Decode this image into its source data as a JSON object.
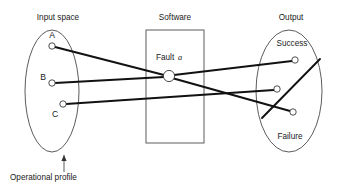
{
  "figure": {
    "type": "diagram",
    "background_color": "#ffffff",
    "line_color": "#111111",
    "outline_color": "#4a4a4a"
  },
  "regions": {
    "input_space": {
      "label": "Input space",
      "shape": "ellipse",
      "label_x": 58,
      "label_y": 20,
      "cx": 52,
      "cy": 91,
      "rx": 27,
      "ry": 61
    },
    "software": {
      "label": "Software",
      "shape": "rectangle",
      "label_x": 175,
      "label_y": 20,
      "x": 146,
      "y": 30,
      "w": 58,
      "h": 113
    },
    "output": {
      "label": "Output",
      "shape": "ellipse",
      "label_x": 291,
      "label_y": 20,
      "cx": 289,
      "cy": 91,
      "rx": 33,
      "ry": 61
    }
  },
  "inner_labels": {
    "fault_text": "Fault",
    "fault_symbol": "a",
    "fault_label_x": 156,
    "fault_label_y": 60,
    "success": "Success",
    "success_x": 292,
    "success_y": 46,
    "failure": "Failure",
    "failure_x": 290,
    "failure_y": 139
  },
  "nodes": {
    "input": [
      {
        "id": "A",
        "label": "A",
        "cx": 52,
        "cy": 46,
        "r": 3.2,
        "label_x": 52,
        "label_y": 38
      },
      {
        "id": "B",
        "label": "B",
        "cx": 52,
        "cy": 83,
        "r": 3.2,
        "label_x": 43,
        "label_y": 80
      },
      {
        "id": "C",
        "label": "C",
        "cx": 63,
        "cy": 104,
        "r": 3.2,
        "label_x": 55,
        "label_y": 117
      }
    ],
    "fault": {
      "id": "fault-a",
      "cx": 169,
      "cy": 76,
      "r": 5.6
    },
    "output": [
      {
        "id": "out1",
        "cx": 295,
        "cy": 60,
        "r": 3.2,
        "region": "success"
      },
      {
        "id": "out2",
        "cx": 277,
        "cy": 89,
        "r": 3.2,
        "region": "success"
      },
      {
        "id": "out3",
        "cx": 293,
        "cy": 112,
        "r": 3.2,
        "region": "failure"
      }
    ]
  },
  "edges": [
    {
      "id": "edge-a-fault",
      "from": "A",
      "to": "fault-a",
      "x1": 55,
      "y1": 47,
      "x2": 164,
      "y2": 75
    },
    {
      "id": "edge-fault-out3",
      "from": "fault-a",
      "to": "out3",
      "x1": 172,
      "y1": 78,
      "x2": 290,
      "y2": 111
    },
    {
      "id": "edge-b-fault",
      "from": "B",
      "to": "fault-a",
      "x1": 55,
      "y1": 83,
      "x2": 164,
      "y2": 77
    },
    {
      "id": "edge-fault-out1",
      "from": "fault-a",
      "to": "out1",
      "x1": 174,
      "y1": 75,
      "x2": 292,
      "y2": 61
    },
    {
      "id": "edge-c-out2",
      "from": "C",
      "to": "out2",
      "x1": 66,
      "y1": 104,
      "x2": 274,
      "y2": 90
    }
  ],
  "divider": {
    "id": "output-partition",
    "x1": 262,
    "y1": 118,
    "x2": 320,
    "y2": 59
  },
  "annotation": {
    "text": "Operational profile",
    "text_x": 10,
    "text_y": 180,
    "pointer_x1": 64,
    "pointer_y1": 172,
    "pointer_x2": 64,
    "pointer_y2": 155
  }
}
